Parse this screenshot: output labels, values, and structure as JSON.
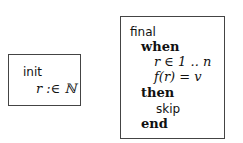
{
  "init_box": {
    "keyword": "init",
    "action": "r :∈ ℕ"
  },
  "final_box": {
    "keyword": "final",
    "when": "when",
    "guards": [
      "r ∈ 1 .. n",
      "f(r) = v"
    ],
    "then": "then",
    "action": "skip",
    "end": "end"
  }
}
